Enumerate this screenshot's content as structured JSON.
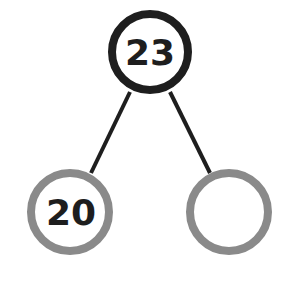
{
  "diagram": {
    "type": "number-bond",
    "whole": {
      "value": "23",
      "stroke": "#1e1e1e"
    },
    "parts": [
      {
        "value": "20",
        "stroke": "#8a8a8a"
      },
      {
        "value": "",
        "stroke": "#8a8a8a"
      }
    ],
    "line_color": "#1e1e1e"
  }
}
